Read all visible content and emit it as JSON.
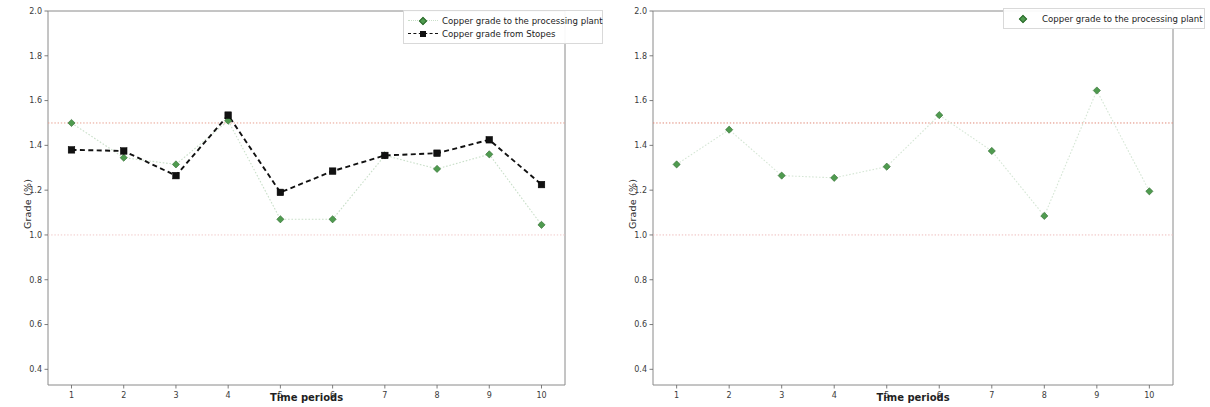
{
  "chart_data": [
    {
      "id": "left-panel",
      "type": "line",
      "title": "",
      "xlabel": "Time periods",
      "ylabel": "Grade (%)",
      "x": [
        1,
        2,
        3,
        4,
        5,
        6,
        7,
        8,
        9,
        10
      ],
      "xticklabels": [
        "1",
        "2",
        "3",
        "4",
        "5",
        "6",
        "7",
        "8",
        "9",
        "10"
      ],
      "yticklabels": [
        "0.4",
        "0.6",
        "0.8",
        "1.0",
        "1.2",
        "1.4",
        "1.6",
        "1.8",
        "2.0"
      ],
      "ylim": [
        0.33,
        2.0
      ],
      "xlim": [
        0.55,
        10.45
      ],
      "grid": false,
      "legend_position": "upper right",
      "series": [
        {
          "name": "Copper grade to the processing plant",
          "color": "#4f9b4f",
          "line_color": "#c9dfc9",
          "marker": "diamond",
          "linestyle": "dotted",
          "values": [
            1.5,
            1.345,
            1.315,
            1.51,
            1.07,
            1.07,
            1.355,
            1.295,
            1.36,
            1.045
          ]
        },
        {
          "name": "Copper grade from Stopes",
          "color": "#111111",
          "line_color": "#111111",
          "marker": "square",
          "linestyle": "dashed",
          "values": [
            1.38,
            1.375,
            1.265,
            1.535,
            1.19,
            1.285,
            1.355,
            1.365,
            1.425,
            1.225
          ]
        }
      ],
      "reference_lines": [
        {
          "value": 1.5,
          "color": "#e8a090",
          "linestyle": "dotted"
        },
        {
          "value": 1.0,
          "color": "#f0c8c8",
          "linestyle": "dotted"
        }
      ]
    },
    {
      "id": "right-panel",
      "type": "line",
      "title": "",
      "xlabel": "Time periods",
      "ylabel": "Grade (%)",
      "x": [
        1,
        2,
        3,
        4,
        5,
        6,
        7,
        8,
        9,
        10
      ],
      "xticklabels": [
        "1",
        "2",
        "3",
        "4",
        "5",
        "6",
        "7",
        "8",
        "9",
        "10"
      ],
      "yticklabels": [
        "0.4",
        "0.6",
        "0.8",
        "1.0",
        "1.2",
        "1.4",
        "1.6",
        "1.8",
        "2.0"
      ],
      "ylim": [
        0.33,
        2.0
      ],
      "xlim": [
        0.55,
        10.45
      ],
      "grid": false,
      "legend_position": "upper right",
      "series": [
        {
          "name": "Copper grade to the processing plant",
          "color": "#4f9b4f",
          "line_color": "#d5e6d5",
          "marker": "diamond",
          "linestyle": "dotted",
          "values": [
            1.315,
            1.47,
            1.265,
            1.255,
            1.305,
            1.535,
            1.375,
            1.085,
            1.645,
            1.195
          ]
        }
      ],
      "reference_lines": [
        {
          "value": 1.5,
          "color": "#e08878",
          "linestyle": "dotted"
        },
        {
          "value": 1.0,
          "color": "#eebcbc",
          "linestyle": "dotted"
        }
      ]
    }
  ],
  "panels": [
    {
      "xlabel": "Time periods",
      "ylabel": "Grade (%)",
      "legend": [
        {
          "label": "Copper grade to the processing plant",
          "marker": "diamond-marker-icon"
        },
        {
          "label": "Copper grade from Stopes",
          "marker": "square-marker-icon"
        }
      ]
    },
    {
      "xlabel": "Time periods",
      "ylabel": "Grade (%)",
      "legend": [
        {
          "label": "Copper grade to the processing plant",
          "marker": "diamond-marker-icon"
        }
      ]
    }
  ]
}
